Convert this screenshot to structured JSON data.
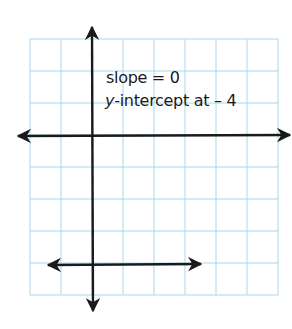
{
  "chart_data": {
    "type": "line",
    "title": "",
    "xlabel": "",
    "ylabel": "",
    "grid": true,
    "xlim": [
      -2,
      6
    ],
    "ylim": [
      -5,
      3
    ],
    "series": [
      {
        "name": "y = -4",
        "x": [
          -1.5,
          3.5
        ],
        "y": [
          -4,
          -4
        ],
        "arrows": "both"
      }
    ],
    "annotations": [
      "slope = 0",
      "y-intercept at −4"
    ]
  },
  "annotation": {
    "line1": "slope = 0",
    "line2_var": "y",
    "line2_rest": "-intercept at – 4"
  },
  "colors": {
    "grid": "#a9d6ea",
    "axis": "#1a1a1a",
    "line": "#1a1a1a",
    "text": "#1a1a1a"
  }
}
